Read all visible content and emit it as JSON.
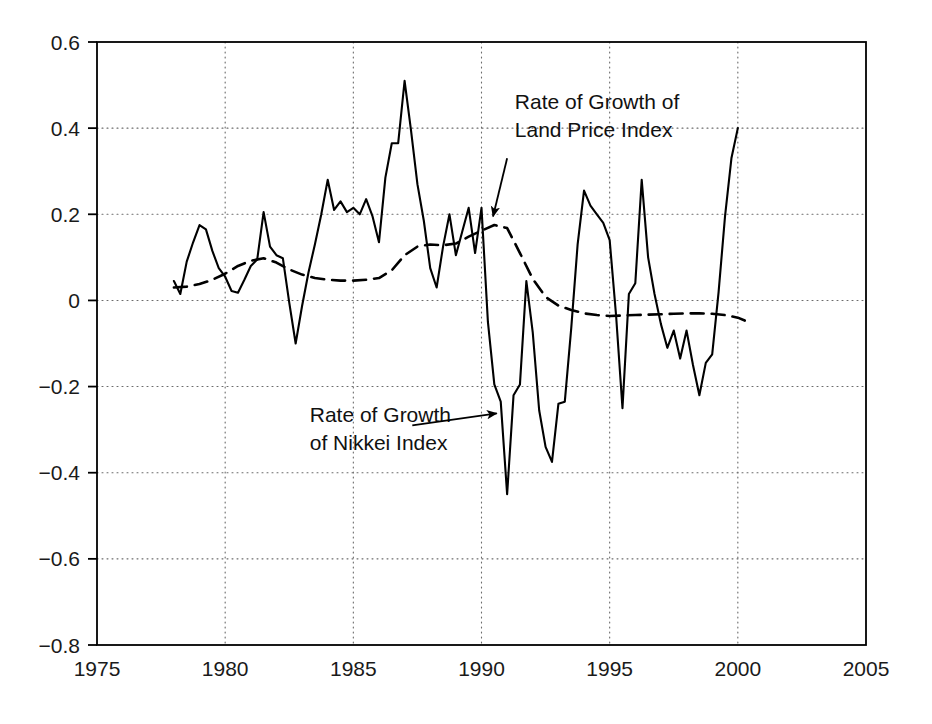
{
  "chart_data": {
    "type": "line",
    "title": "",
    "subtitle": "",
    "xlabel": "",
    "ylabel": "",
    "xlim": [
      1975,
      2005
    ],
    "ylim": [
      -0.8,
      0.6
    ],
    "grid": true,
    "legend_position": "inline-annotations",
    "x_ticks": [
      "1975",
      "1980",
      "1985",
      "1990",
      "1995",
      "2000",
      "2005"
    ],
    "x_tick_values": [
      1975,
      1980,
      1985,
      1990,
      1995,
      2000,
      2005
    ],
    "y_ticks": [
      "0.6",
      "0.4",
      "0.2",
      "0",
      "−0.2",
      "−0.4",
      "−0.6",
      "−0.8"
    ],
    "y_tick_values": [
      0.6,
      0.4,
      0.2,
      0,
      -0.2,
      -0.4,
      -0.6,
      -0.8
    ],
    "annotations": [
      {
        "id": "land-price-annotation",
        "lines": [
          "Rate of Growth of",
          "Land Price Index"
        ],
        "text": "Rate of Growth of Land Price Index",
        "text_x": 1991.3,
        "text_y": 0.445,
        "arrow_from": [
          1991.0,
          0.33
        ],
        "arrow_to": [
          1990.45,
          0.195
        ]
      },
      {
        "id": "nikkei-annotation",
        "lines": [
          "Rate of Growth",
          "of Nikkei Index"
        ],
        "text": "Rate of Growth of Nikkei Index",
        "text_x": 1983.3,
        "text_y": -0.283,
        "arrow_from": [
          1987.3,
          -0.29
        ],
        "arrow_to": [
          1990.6,
          -0.262
        ]
      }
    ],
    "series": [
      {
        "name": "Rate of Growth of Nikkei Index",
        "style": "solid",
        "color": "#000000",
        "width": 2.1,
        "x": [
          1978.0,
          1978.25,
          1978.5,
          1978.75,
          1979.0,
          1979.25,
          1979.5,
          1979.75,
          1980.0,
          1980.25,
          1980.5,
          1980.75,
          1981.0,
          1981.25,
          1981.5,
          1981.75,
          1982.0,
          1982.25,
          1982.5,
          1982.75,
          1983.0,
          1983.25,
          1983.5,
          1983.75,
          1984.0,
          1984.25,
          1984.5,
          1984.75,
          1985.0,
          1985.25,
          1985.5,
          1985.75,
          1986.0,
          1986.25,
          1986.5,
          1986.75,
          1987.0,
          1987.25,
          1987.5,
          1987.75,
          1988.0,
          1988.25,
          1988.5,
          1988.75,
          1989.0,
          1989.25,
          1989.5,
          1989.75,
          1990.0,
          1990.25,
          1990.5,
          1990.75,
          1991.0,
          1991.25,
          1991.5,
          1991.75,
          1992.0,
          1992.25,
          1992.5,
          1992.75,
          1993.0,
          1993.25,
          1993.5,
          1993.75,
          1994.0,
          1994.25,
          1994.5,
          1994.75,
          1995.0,
          1995.25,
          1995.5,
          1995.75,
          1996.0,
          1996.25,
          1996.5,
          1996.75,
          1997.0,
          1997.25,
          1997.5,
          1997.75,
          1998.0,
          1998.25,
          1998.5,
          1998.75,
          1999.0,
          1999.25,
          1999.5,
          1999.75,
          2000.0
        ],
        "y": [
          0.045,
          0.015,
          0.09,
          0.135,
          0.175,
          0.165,
          0.115,
          0.075,
          0.055,
          0.022,
          0.018,
          0.048,
          0.08,
          0.095,
          0.205,
          0.125,
          0.105,
          0.098,
          -0.005,
          -0.1,
          -0.013,
          0.065,
          0.13,
          0.2,
          0.28,
          0.21,
          0.23,
          0.205,
          0.215,
          0.2,
          0.235,
          0.195,
          0.135,
          0.285,
          0.365,
          0.365,
          0.51,
          0.395,
          0.27,
          0.185,
          0.075,
          0.03,
          0.125,
          0.2,
          0.105,
          0.16,
          0.215,
          0.11,
          0.215,
          -0.05,
          -0.195,
          -0.235,
          -0.45,
          -0.22,
          -0.195,
          0.045,
          -0.075,
          -0.255,
          -0.34,
          -0.375,
          -0.24,
          -0.235,
          -0.065,
          0.13,
          0.255,
          0.22,
          0.2,
          0.18,
          0.14,
          -0.035,
          -0.25,
          0.015,
          0.04,
          0.28,
          0.1,
          0.015,
          -0.055,
          -0.11,
          -0.07,
          -0.135,
          -0.07,
          -0.15,
          -0.22,
          -0.145,
          -0.125,
          0.02,
          0.195,
          0.33,
          0.4
        ]
      },
      {
        "name": "Rate of Growth of Land Price Index",
        "style": "dashed",
        "color": "#000000",
        "width": 2.6,
        "x": [
          1978.0,
          1978.5,
          1979.0,
          1979.5,
          1980.0,
          1980.5,
          1981.0,
          1981.5,
          1982.0,
          1982.5,
          1983.0,
          1983.5,
          1984.0,
          1984.5,
          1985.0,
          1985.5,
          1986.0,
          1986.5,
          1987.0,
          1987.5,
          1988.0,
          1988.5,
          1989.0,
          1989.5,
          1990.0,
          1990.5,
          1991.0,
          1991.5,
          1992.0,
          1992.5,
          1993.0,
          1993.5,
          1994.0,
          1994.5,
          1995.0,
          1995.5,
          1996.0,
          1996.5,
          1997.0,
          1997.5,
          1998.0,
          1998.5,
          1999.0,
          1999.5,
          2000.0,
          2000.4
        ],
        "y": [
          0.03,
          0.032,
          0.038,
          0.048,
          0.062,
          0.08,
          0.092,
          0.098,
          0.088,
          0.072,
          0.06,
          0.052,
          0.048,
          0.046,
          0.046,
          0.048,
          0.052,
          0.07,
          0.105,
          0.125,
          0.13,
          0.128,
          0.132,
          0.148,
          0.162,
          0.175,
          0.168,
          0.11,
          0.05,
          0.008,
          -0.012,
          -0.022,
          -0.03,
          -0.034,
          -0.036,
          -0.035,
          -0.034,
          -0.033,
          -0.032,
          -0.031,
          -0.03,
          -0.03,
          -0.031,
          -0.034,
          -0.04,
          -0.05
        ]
      }
    ]
  },
  "axes": {
    "frame_color": "#000000",
    "grid_color": "#6b6b6b"
  }
}
